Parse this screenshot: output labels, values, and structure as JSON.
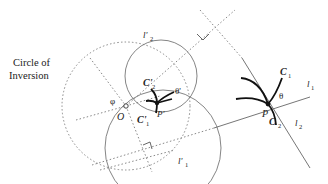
{
  "title": "Circle of Inversion",
  "labels": {
    "circle_of_inversion_line1": "Circle of",
    "circle_of_inversion_line2": "Inversion",
    "O": "O",
    "phi": "φ",
    "P": "P",
    "P_prime": "P'",
    "theta": "θ",
    "theta_prime": "θ'",
    "C1": "C",
    "C1_sub": "1",
    "C2": "C",
    "C2_sub": "2",
    "C1_prime": "C'",
    "C1_prime_sub": "1",
    "C2_prime": "C'",
    "C2_prime_sub": "2",
    "l1": "l",
    "l1_sub": "1",
    "l2": "l",
    "l2_sub": "2",
    "l1_prime": "l'",
    "l1_prime_sub": "1",
    "l2_prime": "l'",
    "l2_prime_sub": "2"
  },
  "colors": {
    "ink": "#222222",
    "dotted": "#888888",
    "background": "#ffffff"
  }
}
